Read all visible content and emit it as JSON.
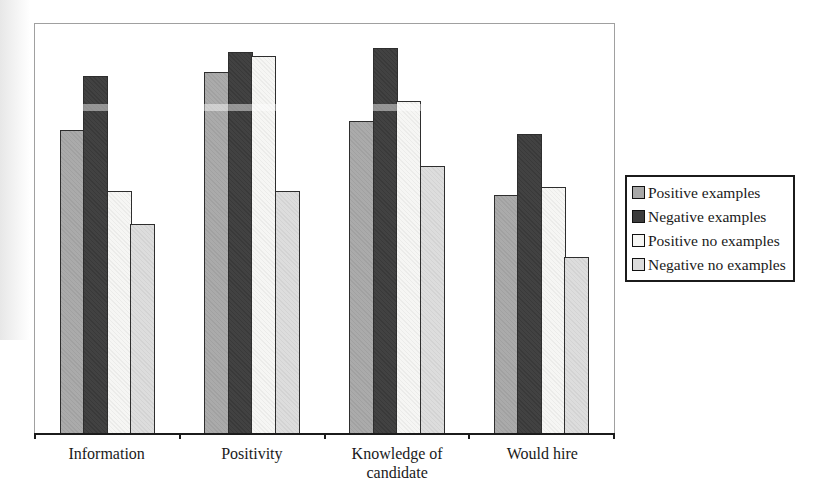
{
  "chart_data": {
    "type": "bar",
    "title": "",
    "categories": [
      "Information",
      "Positivity",
      "Knowledge of candidate",
      "Would hire"
    ],
    "series": [
      {
        "name": "Positive examples",
        "color": "#a8a8a8",
        "values": [
          0.74,
          0.88,
          0.76,
          0.58
        ]
      },
      {
        "name": "Negative examples",
        "color": "#3c3c3c",
        "values": [
          0.87,
          0.93,
          0.94,
          0.73
        ]
      },
      {
        "name": "Positive no examples",
        "color": "#f6f6f4",
        "values": [
          0.59,
          0.92,
          0.81,
          0.6
        ]
      },
      {
        "name": "Negative no examples",
        "color": "#dcdcdc",
        "values": [
          0.51,
          0.59,
          0.65,
          0.43
        ]
      }
    ],
    "xlabel": "",
    "ylabel": "",
    "ylim": [
      0,
      1
    ],
    "value_scale_note": "No y-axis ticks or value labels are shown in the figure; values are bar heights measured as a fraction of the plot height.",
    "legend_position": "right",
    "grid": false,
    "colors": {
      "bar_border": "#2e2e2e",
      "plot_border": "#a0a0a0",
      "axis_line": "#1b1b1b",
      "text": "#1a1a1a",
      "background": "#ffffff"
    }
  }
}
